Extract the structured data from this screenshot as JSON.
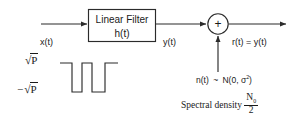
{
  "diagram": {
    "stroke_color": "#2b2b2b",
    "text_color": "#1a1a1a",
    "background": "#ffffff"
  },
  "blocks": {
    "filter": {
      "line1": "Linear Filter",
      "line2": "h(t)"
    },
    "adder": {
      "symbol": "+"
    }
  },
  "signals": {
    "input_label": "x(t)",
    "filter_output_label": "y(t)",
    "output_label": "r(t) = y(t)"
  },
  "waveform": {
    "high_label_sqrt": "√",
    "high_label_arg": "P",
    "low_label_sign": "−",
    "low_label_sqrt": "√",
    "low_label_arg": "P"
  },
  "noise": {
    "distribution_prefix": "n(t)",
    "tilde": "~",
    "distribution": "N(0, σ",
    "distribution_exp": "2",
    "distribution_close": ")",
    "spectral_text": "Spectral density",
    "spectral_num": "N",
    "spectral_num_sub": "0",
    "spectral_den": "2"
  }
}
